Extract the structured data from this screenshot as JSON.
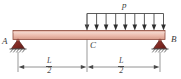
{
  "figure": {
    "type": "engineering-free-body-diagram",
    "colors": {
      "beam_fill": "#e8b4a4",
      "beam_fill_light": "#f2cfc4",
      "beam_edge": "#8c4a3c",
      "support_fill": "#8c2f28",
      "support_edge": "#5a1f1a",
      "line": "#4a4a4a",
      "label": "#3a3a3a",
      "background": "#ffffff"
    },
    "labels": {
      "point_a": "A",
      "point_b": "B",
      "point_c": "C",
      "load": "p"
    },
    "dimensions": [
      {
        "id": "left-span",
        "numerator": "L",
        "denominator": "2",
        "from": "A",
        "to": "C"
      },
      {
        "id": "right-span",
        "numerator": "L",
        "denominator": "2",
        "from": "C",
        "to": "B"
      }
    ],
    "load": {
      "symbol": "p",
      "kind": "uniformly-distributed",
      "arrow_count": 9,
      "direction": "down",
      "span_from": "C",
      "span_to": "B"
    },
    "supports": [
      {
        "id": "support-a",
        "at": "A",
        "kind": "pin",
        "hatched": true
      },
      {
        "id": "support-b",
        "at": "B",
        "kind": "pin",
        "hatched": true
      }
    ]
  }
}
